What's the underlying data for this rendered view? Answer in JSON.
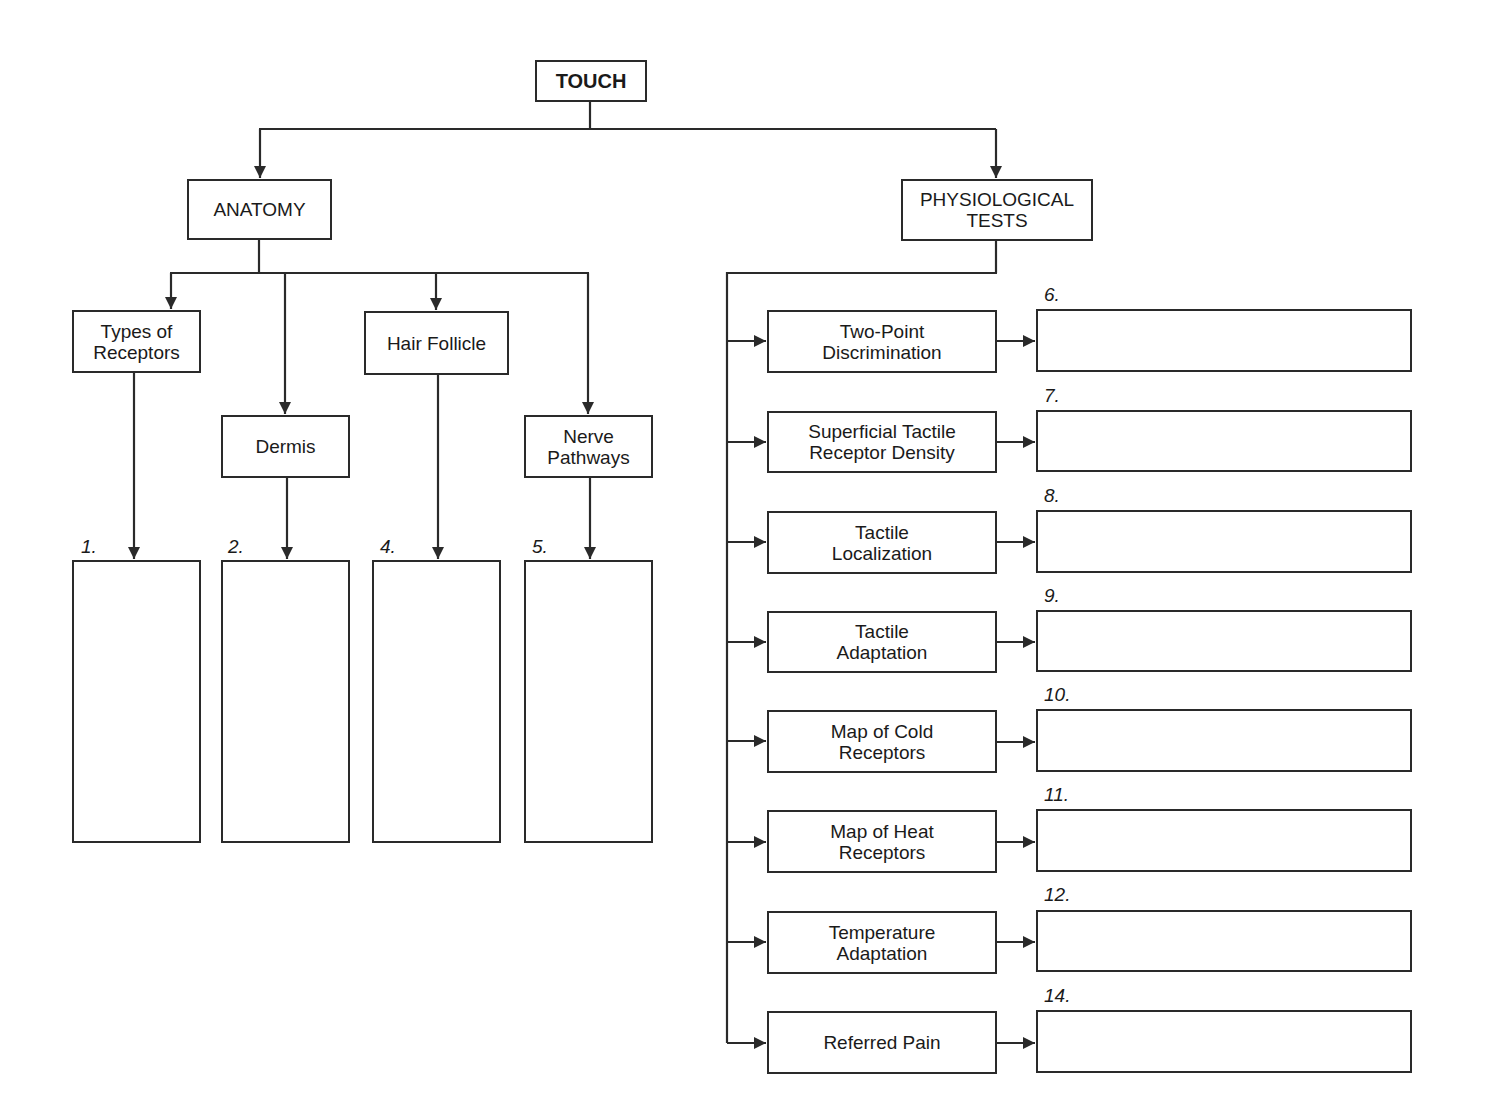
{
  "root": {
    "label": "TOUCH"
  },
  "anatomy": {
    "label": "ANATOMY",
    "children": [
      {
        "label": "Types of\nReceptors",
        "answer_number": "1."
      },
      {
        "label": "Dermis",
        "answer_number": "2."
      },
      {
        "label": "Hair Follicle",
        "answer_number": "4."
      },
      {
        "label": "Nerve\nPathways",
        "answer_number": "5."
      }
    ]
  },
  "physiological_tests": {
    "label": "PHYSIOLOGICAL\nTESTS",
    "children": [
      {
        "label": "Two-Point\nDiscrimination",
        "answer_number": "6."
      },
      {
        "label": "Superficial Tactile\nReceptor Density",
        "answer_number": "7."
      },
      {
        "label": "Tactile\nLocalization",
        "answer_number": "8."
      },
      {
        "label": "Tactile\nAdaptation",
        "answer_number": "9."
      },
      {
        "label": "Map of Cold\nReceptors",
        "answer_number": "10."
      },
      {
        "label": "Map of Heat\nReceptors",
        "answer_number": "11."
      },
      {
        "label": "Temperature\nAdaptation",
        "answer_number": "12."
      },
      {
        "label": "Referred Pain",
        "answer_number": "14."
      }
    ]
  },
  "colors": {
    "line": "#2a2a2a",
    "background": "#ffffff",
    "text": "#1a1a1a"
  }
}
